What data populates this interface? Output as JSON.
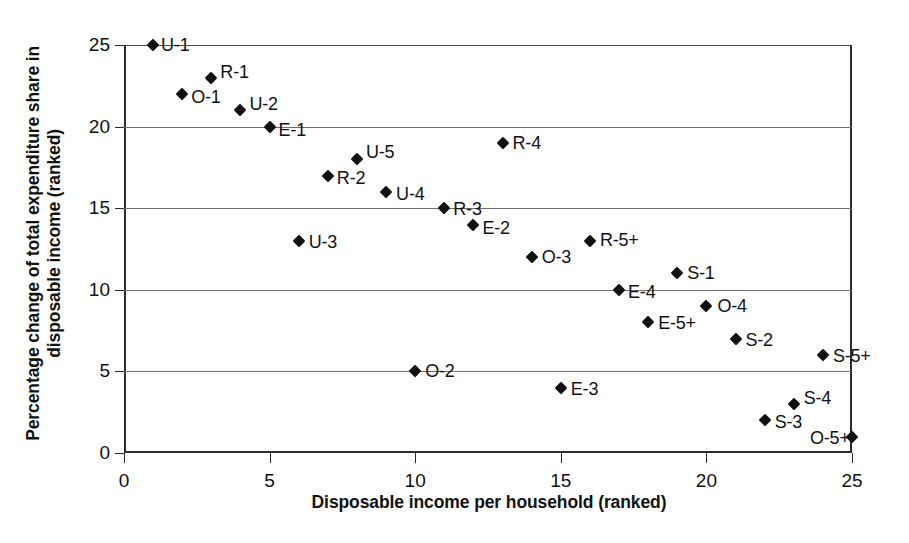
{
  "chart_data": {
    "type": "scatter",
    "title": "",
    "xlabel": "Disposable income per household (ranked)",
    "ylabel": "Percentage change of total expenditure share in disposable income (ranked)",
    "xlim": [
      0,
      25
    ],
    "ylim": [
      0,
      25
    ],
    "xticks": [
      0,
      5,
      10,
      15,
      20,
      25
    ],
    "yticks": [
      0,
      5,
      10,
      15,
      20,
      25
    ],
    "grid": "horizontal",
    "legend": "none",
    "series": [
      {
        "name": "households",
        "points": [
          {
            "label": "U-1",
            "x": 1,
            "y": 25,
            "lx": 8,
            "ly": 0
          },
          {
            "label": "O-1",
            "x": 2,
            "y": 22,
            "lx": 9,
            "ly": 3
          },
          {
            "label": "R-1",
            "x": 3,
            "y": 23,
            "lx": 9,
            "ly": -6
          },
          {
            "label": "U-2",
            "x": 4,
            "y": 21,
            "lx": 9,
            "ly": -6
          },
          {
            "label": "E-1",
            "x": 5,
            "y": 20,
            "lx": 9,
            "ly": 3
          },
          {
            "label": "U-3",
            "x": 6,
            "y": 13,
            "lx": 10,
            "ly": 1
          },
          {
            "label": "R-2",
            "x": 7,
            "y": 17,
            "lx": 9,
            "ly": 2
          },
          {
            "label": "U-5",
            "x": 8,
            "y": 18,
            "lx": 9,
            "ly": -7
          },
          {
            "label": "U-4",
            "x": 9,
            "y": 16,
            "lx": 10,
            "ly": 2
          },
          {
            "label": "O-2",
            "x": 10,
            "y": 5,
            "lx": 10,
            "ly": 0
          },
          {
            "label": "R-3",
            "x": 11,
            "y": 15,
            "lx": 9,
            "ly": 1
          },
          {
            "label": "E-2",
            "x": 12,
            "y": 14,
            "lx": 9,
            "ly": 3
          },
          {
            "label": "R-4",
            "x": 13,
            "y": 19,
            "lx": 10,
            "ly": 0
          },
          {
            "label": "O-3",
            "x": 14,
            "y": 12,
            "lx": 10,
            "ly": 0
          },
          {
            "label": "E-3",
            "x": 15,
            "y": 4,
            "lx": 10,
            "ly": 1
          },
          {
            "label": "R-5+",
            "x": 16,
            "y": 13,
            "lx": 10,
            "ly": -1
          },
          {
            "label": "E-4",
            "x": 17,
            "y": 10,
            "lx": 9,
            "ly": 2
          },
          {
            "label": "E-5+",
            "x": 18,
            "y": 8,
            "lx": 10,
            "ly": 1
          },
          {
            "label": "S-1",
            "x": 19,
            "y": 11,
            "lx": 10,
            "ly": 0
          },
          {
            "label": "O-4",
            "x": 20,
            "y": 9,
            "lx": 11,
            "ly": 0
          },
          {
            "label": "S-2",
            "x": 21,
            "y": 7,
            "lx": 10,
            "ly": 1
          },
          {
            "label": "S-3",
            "x": 22,
            "y": 2,
            "lx": 10,
            "ly": 2
          },
          {
            "label": "S-4",
            "x": 23,
            "y": 3,
            "lx": 10,
            "ly": -6
          },
          {
            "label": "S-5+",
            "x": 24,
            "y": 6,
            "lx": 10,
            "ly": 1
          },
          {
            "label": "O-5+",
            "x": 25,
            "y": 1,
            "lx": -42,
            "ly": 1
          }
        ]
      }
    ]
  },
  "caption": {
    "text": ""
  }
}
